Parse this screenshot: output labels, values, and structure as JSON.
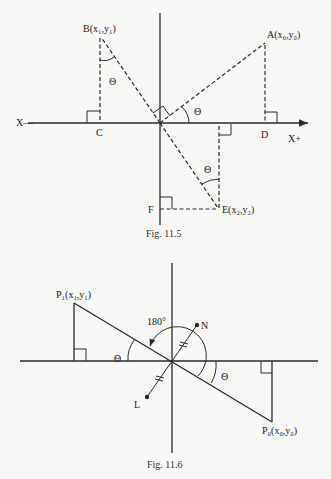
{
  "figures": [
    {
      "caption": "Fig. 11.5",
      "labels": {
        "B": "B(x₁,y₁)",
        "A": "A(x₀,y₀)",
        "E": "E(x₂,y₂)",
        "C": "C",
        "D": "D",
        "F": "F",
        "x_neg": "X—",
        "x_pos": "X+",
        "theta1": "Θ",
        "theta2": "Θ",
        "theta3": "Θ"
      }
    },
    {
      "caption": "Fig. 11.6",
      "labels": {
        "P1": "P₁(x₁,y₁)",
        "P0": "P₀(x₀,y₀)",
        "N": "N",
        "L": "L",
        "rotation": "180°",
        "theta1": "Θ",
        "theta2": "Θ"
      }
    }
  ]
}
